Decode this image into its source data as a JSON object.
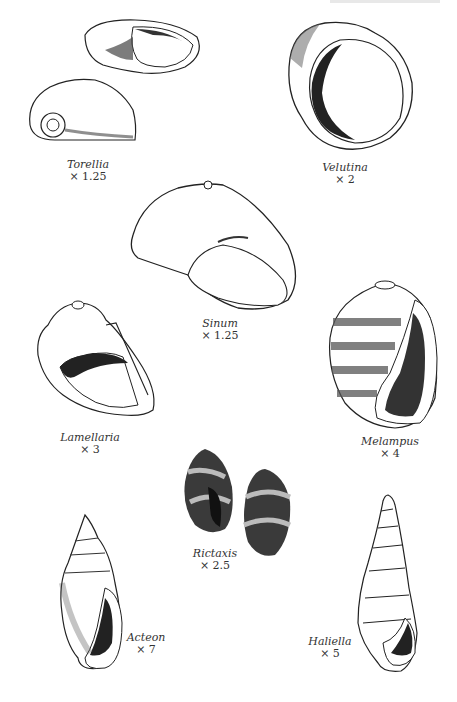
{
  "plate": {
    "specimens": [
      {
        "name": "Torellia",
        "magnification": "× 1.25"
      },
      {
        "name": "Velutina",
        "magnification": "× 2"
      },
      {
        "name": "Sinum",
        "magnification": "× 1.25"
      },
      {
        "name": "Lamellaria",
        "magnification": "× 3"
      },
      {
        "name": "Melampus",
        "magnification": "× 4"
      },
      {
        "name": "Rictaxis",
        "magnification": "× 2.5"
      },
      {
        "name": "Acteon",
        "magnification": "× 7"
      },
      {
        "name": "Haliella",
        "magnification": "× 5"
      }
    ]
  },
  "colors": {
    "ink": "#1a1a1a",
    "paper": "#ffffff",
    "shade": "#555555"
  }
}
